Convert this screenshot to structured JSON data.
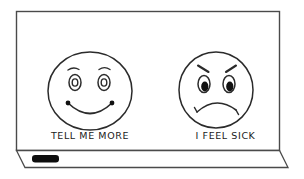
{
  "scene": {
    "title": "Whiteboard with two feedback faces",
    "background_color": "#ffffff",
    "ink_color": "#2b2b2b",
    "board_fill": "#ffffff"
  },
  "board": {
    "name": "whiteboard",
    "frame_color": "#4a4a4a",
    "ledge_color": "#4a4a4a",
    "ledge_fill": "#ffffff"
  },
  "marker": {
    "name": "marker",
    "color": "#0d0d0d",
    "label": ""
  },
  "faces": [
    {
      "id": "happy",
      "expression": "smiling",
      "caption": "TELL ME MORE",
      "outline_color": "#2b2b2b",
      "fill_color": "#ffffff",
      "eye_style": "concentric-oval",
      "mouth": "smile"
    },
    {
      "id": "sad",
      "expression": "frowning",
      "caption": "I FEEL SICK",
      "outline_color": "#2b2b2b",
      "fill_color": "#ffffff",
      "eye_style": "half-filled-oval",
      "mouth": "frown"
    }
  ],
  "captions": {
    "left": "TELL ME MORE",
    "right": "I FEEL SICK"
  }
}
